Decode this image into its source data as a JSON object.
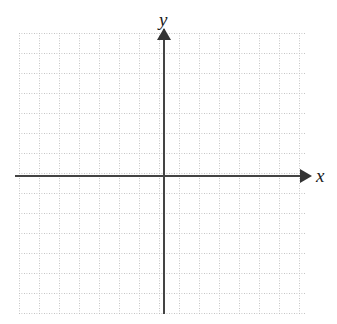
{
  "figure": {
    "title": "",
    "type": "blank-coordinate-grid",
    "background_color": "#ffffff"
  },
  "axes": {
    "x_label": "x",
    "y_label": "y",
    "axis_color": "#444444",
    "arrowhead_color": "#333333",
    "origin": {
      "x_px": 164,
      "y_px": 176
    }
  },
  "grid": {
    "line_color": "#bdbdbd",
    "style": "dotted",
    "cell_size_px": 20,
    "columns": 14,
    "rows": 14,
    "left_px": 19,
    "top_px": 33,
    "width_px": 286,
    "height_px": 280
  },
  "chart_data": {
    "type": "scatter",
    "title": "",
    "subtitle": "",
    "xlabel": "x",
    "ylabel": "y",
    "x": [],
    "y": [],
    "series": [],
    "annotations": [],
    "legend": [],
    "legend_position": "none",
    "grid": true,
    "grid_spacing": 1,
    "xlim": [
      -7.25,
      7.05
    ],
    "ylim": [
      -6.85,
      7.15
    ],
    "xticks": [
      -7,
      -6,
      -5,
      -4,
      -3,
      -2,
      -1,
      0,
      1,
      2,
      3,
      4,
      5,
      6,
      7
    ],
    "yticks": [
      -6,
      -5,
      -4,
      -3,
      -2,
      -1,
      0,
      1,
      2,
      3,
      4,
      5,
      6,
      7
    ],
    "xtick_labels": [],
    "ytick_labels": []
  }
}
